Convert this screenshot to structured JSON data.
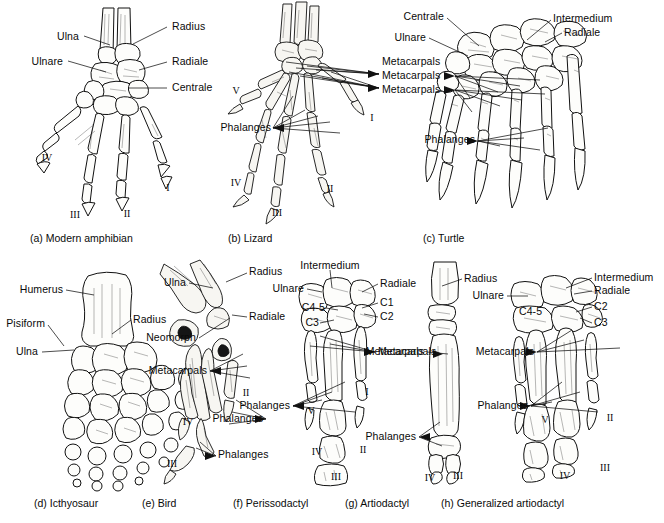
{
  "figure": {
    "background_color": "#ffffff",
    "ink_color": "#111111",
    "bone_fill": "#fdfdfb"
  },
  "panels": [
    {
      "id": "a",
      "caption": "(a) Modern amphibian",
      "labels": [
        {
          "text": "Ulna",
          "x": 79,
          "y": 37,
          "align": "right",
          "leader": [
            [
              82,
              37
            ],
            [
              103,
              45
            ]
          ]
        },
        {
          "text": "Radius",
          "x": 172,
          "y": 27,
          "align": "left",
          "leader": [
            [
              169,
              27
            ],
            [
              131,
              44
            ]
          ]
        },
        {
          "text": "Ulnare",
          "x": 63,
          "y": 62,
          "align": "right",
          "leader": [
            [
              66,
              62
            ],
            [
              104,
              71
            ]
          ]
        },
        {
          "text": "Radiale",
          "x": 172,
          "y": 62,
          "align": "left",
          "leader": [
            [
              169,
              62
            ],
            [
              140,
              69
            ]
          ]
        },
        {
          "text": "Centrale",
          "x": 172,
          "y": 88,
          "align": "left",
          "leader": [
            [
              169,
              88
            ],
            [
              130,
              88
            ]
          ]
        }
      ],
      "digits": [
        {
          "text": "IV",
          "x": 47,
          "y": 158
        },
        {
          "text": "III",
          "x": 75,
          "y": 215
        },
        {
          "text": "II",
          "x": 127,
          "y": 214
        },
        {
          "text": "I",
          "x": 168,
          "y": 188
        }
      ]
    },
    {
      "id": "b",
      "caption": "(b) Lizard",
      "labels": [
        {
          "text": "Metacarpals",
          "x": 382,
          "y": 76,
          "align": "left"
        },
        {
          "text": "Metacarpals",
          "x": 382,
          "y": 90,
          "align": "left"
        },
        {
          "text": "Phalanges",
          "x": 230,
          "y": 128,
          "align": "right"
        }
      ],
      "digits": [
        {
          "text": "V",
          "x": 236,
          "y": 91
        },
        {
          "text": "IV",
          "x": 236,
          "y": 183
        },
        {
          "text": "III",
          "x": 277,
          "y": 213
        },
        {
          "text": "II",
          "x": 330,
          "y": 189
        },
        {
          "text": "I",
          "x": 372,
          "y": 118
        }
      ]
    },
    {
      "id": "c",
      "caption": "(c) Turtle",
      "labels": [
        {
          "text": "Centrale",
          "x": 444,
          "y": 17,
          "align": "right"
        },
        {
          "text": "Ulnare",
          "x": 426,
          "y": 38,
          "align": "right"
        },
        {
          "text": "Intermedium",
          "x": 553,
          "y": 19,
          "align": "left"
        },
        {
          "text": "Radiale",
          "x": 564,
          "y": 33,
          "align": "left"
        },
        {
          "text": "Metacarpals",
          "x": 382,
          "y": 76,
          "align": "left"
        },
        {
          "text": "Phalanges",
          "x": 434,
          "y": 140,
          "align": "right"
        }
      ],
      "digits": []
    },
    {
      "id": "d",
      "caption": "(d) Icthyosaur",
      "labels": [
        {
          "text": "Humerus",
          "x": 63,
          "y": 290,
          "align": "right",
          "leader": [
            [
              66,
              290
            ],
            [
              93,
              294
            ]
          ]
        },
        {
          "text": "Radius",
          "x": 133,
          "y": 320,
          "align": "left",
          "leader": [
            [
              130,
              320
            ],
            [
              110,
              333
            ]
          ]
        },
        {
          "text": "Pisiform",
          "x": 45,
          "y": 324,
          "align": "right",
          "leader": [
            [
              48,
              324
            ],
            [
              62,
              344
            ]
          ]
        },
        {
          "text": "Ulna",
          "x": 38,
          "y": 352,
          "align": "right",
          "leader": [
            [
              41,
              352
            ],
            [
              72,
              349
            ]
          ]
        }
      ],
      "digits": []
    },
    {
      "id": "e",
      "caption": "(e) Bird",
      "labels": [
        {
          "text": "Ulna",
          "x": 186,
          "y": 283,
          "align": "right"
        },
        {
          "text": "Radius",
          "x": 249,
          "y": 272,
          "align": "left"
        },
        {
          "text": "Radiale",
          "x": 249,
          "y": 317,
          "align": "left"
        },
        {
          "text": "Neomorph",
          "x": 196,
          "y": 338,
          "align": "right"
        },
        {
          "text": "Metacarpals",
          "x": 207,
          "y": 371,
          "align": "right"
        },
        {
          "text": "Phalanges",
          "x": 268,
          "y": 419,
          "align": "right"
        },
        {
          "text": "Phalanges",
          "x": 218,
          "y": 455,
          "align": "left"
        }
      ],
      "digits": [
        {
          "text": "II",
          "x": 246,
          "y": 393
        },
        {
          "text": "IV",
          "x": 188,
          "y": 422
        },
        {
          "text": "III",
          "x": 172,
          "y": 464
        }
      ]
    },
    {
      "id": "f",
      "caption": "(f) Perissodactyl",
      "labels": [
        {
          "text": "Intermedium",
          "x": 330,
          "y": 266,
          "align": "center"
        },
        {
          "text": "Ulnare",
          "x": 304,
          "y": 289,
          "align": "right"
        },
        {
          "text": "Radiale",
          "x": 380,
          "y": 284,
          "align": "left"
        },
        {
          "text": "C4-5",
          "x": 302,
          "y": 308,
          "align": "left"
        },
        {
          "text": "C1",
          "x": 380,
          "y": 303,
          "align": "left"
        },
        {
          "text": "C2",
          "x": 380,
          "y": 317,
          "align": "left"
        },
        {
          "text": "C3",
          "x": 305,
          "y": 323,
          "align": "left"
        },
        {
          "text": "Metacarpals",
          "x": 378,
          "y": 352,
          "align": "left"
        },
        {
          "text": "Phalanges",
          "x": 290,
          "y": 406,
          "align": "right"
        }
      ],
      "digits": [
        {
          "text": "V",
          "x": 311,
          "y": 411
        },
        {
          "text": "I",
          "x": 367,
          "y": 392
        },
        {
          "text": "IV",
          "x": 317,
          "y": 452
        },
        {
          "text": "II",
          "x": 363,
          "y": 450
        },
        {
          "text": "III",
          "x": 336,
          "y": 477
        }
      ]
    },
    {
      "id": "g",
      "caption": "(g) Artiodactyl",
      "labels": [
        {
          "text": "Metacarpals",
          "x": 424,
          "y": 352,
          "align": "right"
        },
        {
          "text": "Phalanges",
          "x": 416,
          "y": 437,
          "align": "right"
        }
      ],
      "digits": [
        {
          "text": "IV",
          "x": 430,
          "y": 478
        },
        {
          "text": "III",
          "x": 458,
          "y": 476
        }
      ]
    },
    {
      "id": "h",
      "caption": "(h) Generalized artiodactyl",
      "labels": [
        {
          "text": "Radius",
          "x": 464,
          "y": 279,
          "align": "left"
        },
        {
          "text": "Ulnare",
          "x": 504,
          "y": 296,
          "align": "right"
        },
        {
          "text": "Intermedium",
          "x": 594,
          "y": 278,
          "align": "left"
        },
        {
          "text": "Radiale",
          "x": 594,
          "y": 291,
          "align": "left"
        },
        {
          "text": "C4-5",
          "x": 519,
          "y": 312,
          "align": "left"
        },
        {
          "text": "C2",
          "x": 594,
          "y": 307,
          "align": "left"
        },
        {
          "text": "C3",
          "x": 594,
          "y": 323,
          "align": "left"
        },
        {
          "text": "Metacarpals",
          "x": 534,
          "y": 352,
          "align": "right"
        },
        {
          "text": "Phalanges",
          "x": 528,
          "y": 406,
          "align": "right"
        }
      ],
      "digits": [
        {
          "text": "V",
          "x": 545,
          "y": 420
        },
        {
          "text": "II",
          "x": 610,
          "y": 418
        },
        {
          "text": "IV",
          "x": 565,
          "y": 476
        },
        {
          "text": "III",
          "x": 605,
          "y": 468
        }
      ]
    }
  ],
  "captions": [
    {
      "text": "(a) Modern amphibian",
      "x": 30,
      "y": 238
    },
    {
      "text": "(b) Lizard",
      "x": 228,
      "y": 238
    },
    {
      "text": "(c) Turtle",
      "x": 423,
      "y": 238
    },
    {
      "text": "(d) Icthyosaur",
      "x": 34,
      "y": 503
    },
    {
      "text": "(e) Bird",
      "x": 142,
      "y": 503
    },
    {
      "text": "(f) Perissodactyl",
      "x": 233,
      "y": 503
    },
    {
      "text": "(g) Artiodactyl",
      "x": 345,
      "y": 503
    },
    {
      "text": "(h) Generalized artiodactyl",
      "x": 441,
      "y": 503
    }
  ]
}
